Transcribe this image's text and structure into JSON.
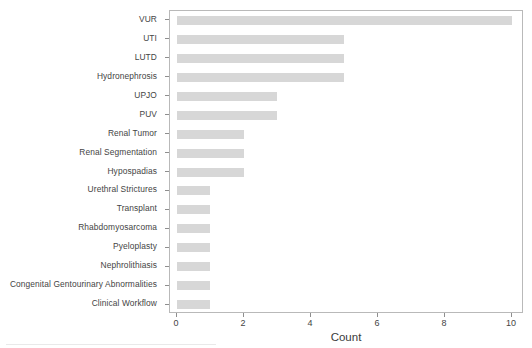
{
  "chart_data": {
    "type": "bar",
    "orientation": "horizontal",
    "title": "",
    "subtitle": "",
    "xlabel": "Count",
    "ylabel": "",
    "categories": [
      "VUR",
      "UTI",
      "LUTD",
      "Hydronephrosis",
      "UPJO",
      "PUV",
      "Renal Tumor",
      "Renal Segmentation",
      "Hypospadias",
      "Urethral Strictures",
      "Transplant",
      "Rhabdomyosarcoma",
      "Pyeloplasty",
      "Nephrolithiasis",
      "Congenital Gentourinary Abnormalities",
      "Clinical Workflow"
    ],
    "values": [
      10,
      5,
      5,
      5,
      3,
      3,
      2,
      2,
      2,
      1,
      1,
      1,
      1,
      1,
      1,
      1
    ],
    "xticks": [
      0,
      2,
      4,
      6,
      8,
      10
    ],
    "xtick_labels": [
      "0",
      "2",
      "4",
      "6",
      "8",
      "10"
    ],
    "xlim": [
      0,
      10.5
    ],
    "grid": false,
    "legend": false,
    "bar_color": "#c8c8c8",
    "frame_color": "#b9b9b9"
  },
  "axis": {
    "x_title": "Count"
  }
}
